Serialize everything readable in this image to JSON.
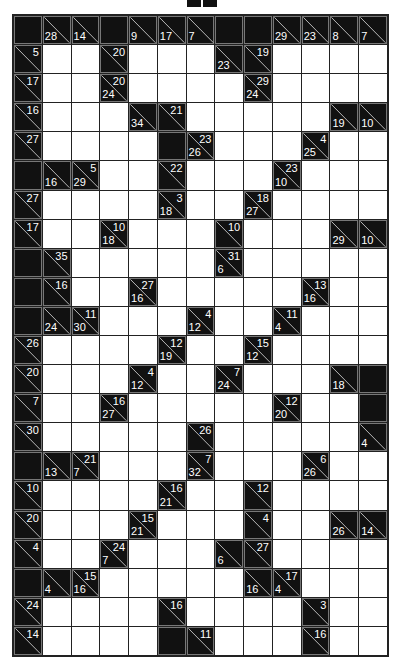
{
  "puzzle": {
    "type": "kakuro",
    "rows": 22,
    "cols": 13,
    "colors": {
      "block": "#111111",
      "white": "#ffffff",
      "grid": "#222222",
      "clue_text": "#ffffff"
    },
    "grid": [
      [
        "B",
        {
          "d": 28
        },
        {
          "d": 14
        },
        "B",
        {
          "d": 9
        },
        {
          "d": 17
        },
        {
          "d": 7
        },
        "B",
        "B",
        {
          "d": 29
        },
        {
          "d": 23
        },
        {
          "d": 8
        },
        {
          "d": 7
        }
      ],
      [
        {
          "r": 5
        },
        "W",
        "W",
        {
          "r": 20
        },
        "W",
        "W",
        "W",
        {
          "d": 23
        },
        {
          "r": 19
        },
        "W",
        "W",
        "W",
        "W"
      ],
      [
        {
          "r": 17
        },
        "W",
        "W",
        {
          "d": 24,
          "r": 20
        },
        "W",
        "W",
        "W",
        "W",
        {
          "d": 24,
          "r": 29
        },
        "W",
        "W",
        "W",
        "W"
      ],
      [
        {
          "r": 16
        },
        "W",
        "W",
        "W",
        {
          "d": 34
        },
        {
          "r": 21
        },
        "W",
        "W",
        "W",
        "W",
        "W",
        {
          "d": 19
        },
        {
          "d": 10
        }
      ],
      [
        {
          "r": 27
        },
        "W",
        "W",
        "W",
        "W",
        "B",
        {
          "d": 26,
          "r": 23
        },
        "W",
        "W",
        "W",
        {
          "d": 25,
          "r": 4
        },
        "W",
        "W"
      ],
      [
        "B",
        {
          "d": 16
        },
        {
          "d": 29,
          "r": 5
        },
        "W",
        "W",
        {
          "r": 22
        },
        "W",
        "W",
        "W",
        {
          "d": 10,
          "r": 23
        },
        "W",
        "W",
        "W"
      ],
      [
        {
          "r": 27
        },
        "W",
        "W",
        "W",
        "W",
        {
          "d": 18,
          "r": 3
        },
        "W",
        "W",
        {
          "d": 27,
          "r": 18
        },
        "W",
        "W",
        "W",
        "W"
      ],
      [
        {
          "r": 17
        },
        "W",
        "W",
        {
          "d": 18,
          "r": 10
        },
        "W",
        "W",
        "W",
        {
          "r": 10
        },
        "W",
        "W",
        "W",
        {
          "d": 29
        },
        {
          "d": 10
        }
      ],
      [
        "B",
        {
          "r": 35
        },
        "W",
        "W",
        "W",
        "W",
        "W",
        {
          "d": 6,
          "r": 31
        },
        "W",
        "W",
        "W",
        "W",
        "W"
      ],
      [
        "B",
        {
          "r": 16
        },
        "W",
        "W",
        {
          "d": 16,
          "r": 27
        },
        "W",
        "W",
        "W",
        "W",
        "W",
        {
          "d": 16,
          "r": 13
        },
        "W",
        "W"
      ],
      [
        "B",
        {
          "d": 24
        },
        {
          "d": 30,
          "r": 11
        },
        "W",
        "W",
        "W",
        {
          "d": 12,
          "r": 4
        },
        "W",
        "W",
        {
          "d": 4,
          "r": 11
        },
        "W",
        "W",
        "W"
      ],
      [
        {
          "r": 26
        },
        "W",
        "W",
        "W",
        "W",
        {
          "d": 19,
          "r": 12
        },
        "W",
        "W",
        {
          "d": 12,
          "r": 15
        },
        "W",
        "W",
        "W",
        "W"
      ],
      [
        {
          "r": 20
        },
        "W",
        "W",
        "W",
        {
          "d": 12,
          "r": 4
        },
        "W",
        "W",
        {
          "d": 24,
          "r": 7
        },
        "W",
        "W",
        "W",
        {
          "d": 18
        },
        "B"
      ],
      [
        {
          "r": 7
        },
        "W",
        "W",
        {
          "d": 27,
          "r": 16
        },
        "W",
        "W",
        "W",
        "W",
        "W",
        {
          "d": 20,
          "r": 12
        },
        "W",
        "W",
        "B"
      ],
      [
        {
          "r": 30
        },
        "W",
        "W",
        "W",
        "W",
        "W",
        {
          "r": 26
        },
        "W",
        "W",
        "W",
        "W",
        "W",
        {
          "d": 4
        }
      ],
      [
        "B",
        {
          "d": 13
        },
        {
          "d": 7,
          "r": 21
        },
        "W",
        "W",
        "W",
        {
          "d": 32,
          "r": 7
        },
        "W",
        "W",
        "W",
        {
          "d": 26,
          "r": 6
        },
        "W",
        "W"
      ],
      [
        {
          "r": 10
        },
        "W",
        "W",
        "W",
        "W",
        {
          "d": 21,
          "r": 16
        },
        "W",
        "W",
        {
          "r": 12
        },
        "W",
        "W",
        "W",
        "W"
      ],
      [
        {
          "r": 20
        },
        "W",
        "W",
        "W",
        {
          "d": 21,
          "r": 15
        },
        "W",
        "W",
        "W",
        {
          "r": 4
        },
        "W",
        "W",
        {
          "d": 26
        },
        {
          "d": 14
        }
      ],
      [
        {
          "r": 4
        },
        "W",
        "W",
        {
          "d": 7,
          "r": 24
        },
        "W",
        "W",
        "W",
        {
          "d": 6
        },
        {
          "r": 27
        },
        "W",
        "W",
        "W",
        "W"
      ],
      [
        "B",
        {
          "d": 4
        },
        {
          "d": 16,
          "r": 15
        },
        "W",
        "W",
        "W",
        "W",
        "W",
        {
          "d": 16
        },
        {
          "d": 4,
          "r": 17
        },
        "W",
        "W",
        "W"
      ],
      [
        {
          "r": 24
        },
        "W",
        "W",
        "W",
        "W",
        {
          "r": 16
        },
        "W",
        "W",
        "W",
        "W",
        {
          "r": 3
        },
        "W",
        "W"
      ],
      [
        {
          "r": 14
        },
        "W",
        "W",
        "W",
        "W",
        "B",
        {
          "r": 11
        },
        "W",
        "W",
        "W",
        {
          "r": 16
        },
        "W",
        "W"
      ]
    ]
  }
}
